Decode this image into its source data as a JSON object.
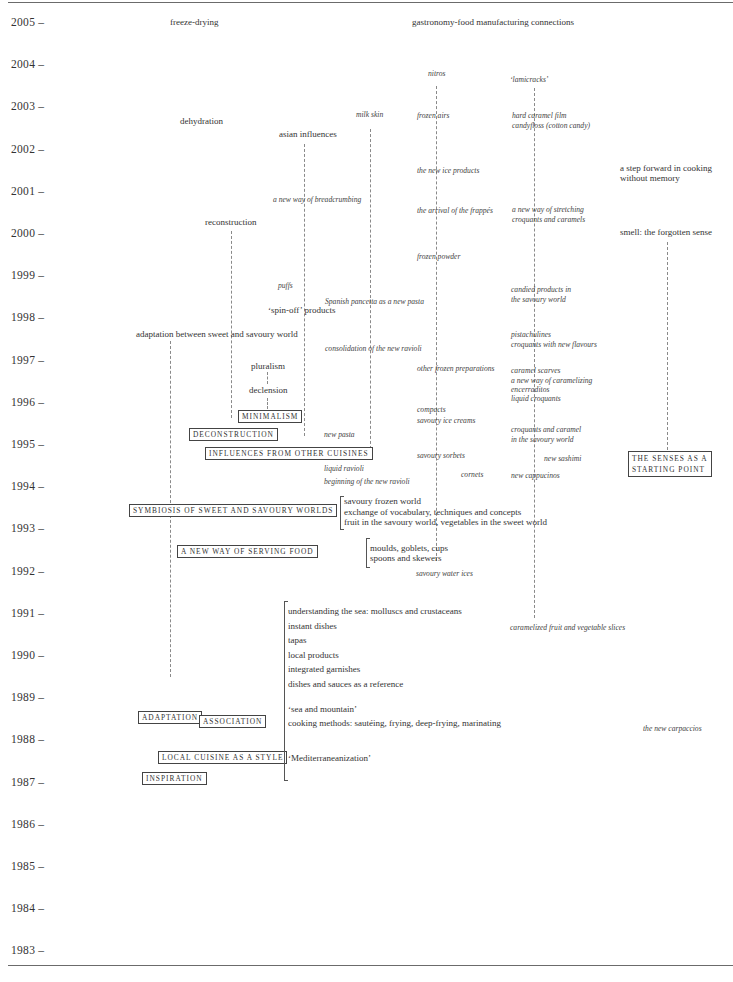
{
  "years": [
    "2005",
    "2004",
    "2003",
    "2002",
    "2001",
    "2000",
    "1999",
    "1998",
    "1997",
    "1996",
    "1995",
    "1994",
    "1993",
    "1992",
    "1991",
    "1990",
    "1989",
    "1988",
    "1987",
    "1986",
    "1985",
    "1984",
    "1983"
  ],
  "headers": {
    "freeze_drying": "freeze-drying",
    "connections": "gastronomy-food manufacturing connections"
  },
  "labels": {
    "dehydration": "dehydration",
    "asian_influences": "asian influences",
    "reconstruction": "reconstruction",
    "spin_off": "‘spin-off’ products",
    "adaptation_world": "adaptation between sweet and savoury world",
    "pluralism": "pluralism",
    "declension": "declension",
    "step_forward_1": "a step forward in cooking",
    "step_forward_2": "without memory",
    "smell": "smell: the forgotten sense"
  },
  "italics": {
    "milk_skin": "milk skin",
    "breadcrumbing": "a new way of breadcrumbing",
    "puffs": "puffs",
    "pancetta": "Spanish pancetta as a new pasta",
    "consolidation": "consolidation of the new ravioli",
    "new_pasta": "new pasta",
    "liquid_ravioli": "liquid ravioli",
    "beginning_ravioli": "beginning of the new ravioli",
    "nitros": "nitros",
    "frozen_airs": "frozen airs",
    "ice_products": "the new ice products",
    "frappes": "the arrival of the frappés",
    "frozen_powder": "frozen powder",
    "other_frozen": "other frozen preparations",
    "compacts": "compacts",
    "savoury_ice_creams": "savoury ice creams",
    "savoury_sorbets": "savoury sorbets",
    "cornets": "cornets",
    "savoury_water_ices": "savoury water ices",
    "lamicracks": "‘lamicracks’",
    "hard_caramel": "hard caramel film",
    "candyfloss": "candyfloss (cotton candy)",
    "stretching_1": "a new way of stretching",
    "stretching_2": "croquants and caramels",
    "candied_1": "candied products in",
    "candied_2": "the savoury world",
    "pistachulines": "pistachulines",
    "croquants_flavours": "croquants with new flavours",
    "caramel_scarves": "caramel scarves",
    "caramelizing": "a new way of caramelizing",
    "encerraditos": "encerraditos",
    "liquid_croquants": "liquid croquants",
    "croquants_caramel_1": "croquants and caramel",
    "croquants_caramel_2": "in the savoury world",
    "new_sashimi": "new sashimi",
    "new_cappucinos": "new cappucinos",
    "caramelized_slices": "caramelized fruit and vegetable slices",
    "new_carpaccios": "the new carpaccios"
  },
  "boxes": {
    "minimalism": "MINIMALISM",
    "deconstruction": "DECONSTRUCTION",
    "influences": "INFLUENCES FROM OTHER CUISINES",
    "senses_1": "THE SENSES AS A",
    "senses_2": "STARTING POINT",
    "symbiosis": "SYMBIOSIS OF SWEET AND SAVOURY WORLDS",
    "serving": "A NEW WAY OF SERVING FOOD",
    "adaptation": "ADAPTATION",
    "association": "ASSOCIATION",
    "local_cuisine": "LOCAL CUISINE AS A STYLE",
    "inspiration": "INSPIRATION"
  },
  "bracket_groups": {
    "frozen_world": [
      "savoury frozen world",
      "exchange of vocabulary, techniques and concepts",
      "fruit in the savoury world, vegetables in the sweet world"
    ],
    "moulds": [
      "moulds, goblets, cups",
      "spoons and skewers"
    ],
    "sea": [
      "understanding the sea: molluscs and crustaceans",
      "instant dishes",
      "tapas",
      "local products",
      "integrated garnishes",
      "dishes and sauces as a reference",
      "",
      "‘sea and mountain’",
      "cooking methods: sautéing, frying, deep-frying, marinating",
      "",
      "",
      "‘Mediterraneanization’"
    ]
  }
}
